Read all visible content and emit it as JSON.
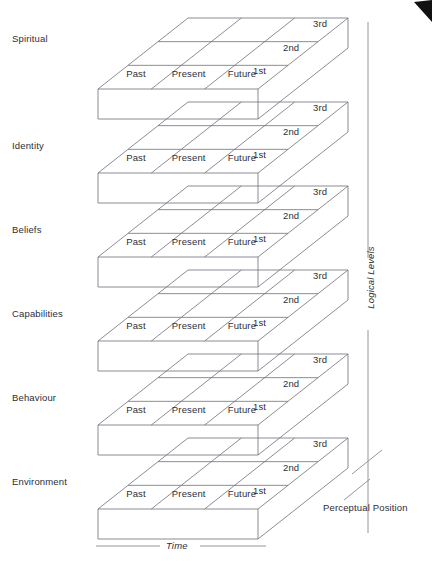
{
  "diagram": {
    "type": "isometric-stacked-grid",
    "title_cropped": "",
    "levels": [
      {
        "id": "spiritual",
        "label": "Spiritual"
      },
      {
        "id": "identity",
        "label": "Identity"
      },
      {
        "id": "beliefs",
        "label": "Beliefs"
      },
      {
        "id": "capabilities",
        "label": "Capabilities"
      },
      {
        "id": "behaviour",
        "label": "Behaviour"
      },
      {
        "id": "environment",
        "label": "Environment"
      }
    ],
    "time_columns": [
      "Past",
      "Present",
      "Future"
    ],
    "position_rows": [
      "1st",
      "2nd",
      "3rd"
    ],
    "axes": {
      "vertical": "Logical Levels",
      "horizontal": "Time",
      "depth": "Perceptual Position"
    },
    "colors": {
      "stroke": "#6f6f78",
      "stroke_light": "#8a8a93",
      "text": "#2e2e38",
      "background": "#ffffff",
      "corner_mark": "#111111"
    },
    "geometry": {
      "layer_count": 6,
      "layer_pitch": 84,
      "front_left_x": 98,
      "front_right_x": 258,
      "front_top_y": 89,
      "front_bottom_y": 119,
      "skew_dx": 90,
      "skew_dy": -71,
      "grid_cols": 3,
      "grid_rows": 3
    }
  }
}
